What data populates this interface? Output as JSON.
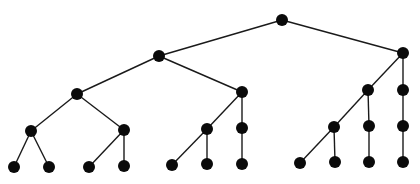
{
  "diagram": {
    "type": "tree",
    "node_color": "#0a0a0a",
    "edge_color": "#1a1a1a",
    "node_radius": 6,
    "nodes": [
      {
        "id": "n0",
        "x": 282,
        "y": 20
      },
      {
        "id": "n1",
        "x": 159,
        "y": 56
      },
      {
        "id": "n2",
        "x": 403,
        "y": 53
      },
      {
        "id": "n3",
        "x": 77,
        "y": 94
      },
      {
        "id": "n4",
        "x": 242,
        "y": 92
      },
      {
        "id": "n5",
        "x": 368,
        "y": 90
      },
      {
        "id": "n6",
        "x": 403,
        "y": 90
      },
      {
        "id": "n7",
        "x": 31,
        "y": 131
      },
      {
        "id": "n8",
        "x": 124,
        "y": 130
      },
      {
        "id": "n9",
        "x": 207,
        "y": 129
      },
      {
        "id": "n10",
        "x": 242,
        "y": 128
      },
      {
        "id": "n11",
        "x": 334,
        "y": 127
      },
      {
        "id": "n12",
        "x": 369,
        "y": 126
      },
      {
        "id": "n13",
        "x": 403,
        "y": 126
      },
      {
        "id": "n14",
        "x": 14,
        "y": 167
      },
      {
        "id": "n15",
        "x": 49,
        "y": 167
      },
      {
        "id": "n16",
        "x": 89,
        "y": 167
      },
      {
        "id": "n17",
        "x": 124,
        "y": 166
      },
      {
        "id": "n18",
        "x": 172,
        "y": 165
      },
      {
        "id": "n19",
        "x": 207,
        "y": 164
      },
      {
        "id": "n20",
        "x": 242,
        "y": 164
      },
      {
        "id": "n21",
        "x": 300,
        "y": 163
      },
      {
        "id": "n22",
        "x": 335,
        "y": 162
      },
      {
        "id": "n23",
        "x": 369,
        "y": 162
      },
      {
        "id": "n24",
        "x": 403,
        "y": 162
      }
    ],
    "edges": [
      [
        "n0",
        "n1"
      ],
      [
        "n0",
        "n2"
      ],
      [
        "n1",
        "n3"
      ],
      [
        "n1",
        "n4"
      ],
      [
        "n2",
        "n5"
      ],
      [
        "n2",
        "n6"
      ],
      [
        "n3",
        "n7"
      ],
      [
        "n3",
        "n8"
      ],
      [
        "n4",
        "n9"
      ],
      [
        "n4",
        "n10"
      ],
      [
        "n5",
        "n11"
      ],
      [
        "n5",
        "n12"
      ],
      [
        "n6",
        "n13"
      ],
      [
        "n7",
        "n14"
      ],
      [
        "n7",
        "n15"
      ],
      [
        "n8",
        "n16"
      ],
      [
        "n8",
        "n17"
      ],
      [
        "n9",
        "n18"
      ],
      [
        "n9",
        "n19"
      ],
      [
        "n10",
        "n20"
      ],
      [
        "n11",
        "n21"
      ],
      [
        "n11",
        "n22"
      ],
      [
        "n12",
        "n23"
      ],
      [
        "n13",
        "n24"
      ]
    ]
  }
}
